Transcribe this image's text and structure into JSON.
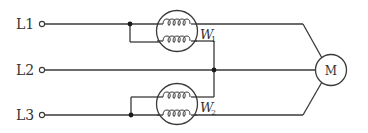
{
  "diagram": {
    "lines": [
      {
        "id": "L1",
        "label": "L1",
        "y": 24
      },
      {
        "id": "L2",
        "label": "L2",
        "y": 70
      },
      {
        "id": "L3",
        "label": "L3",
        "y": 115
      }
    ],
    "wattmeters": [
      {
        "id": "W1",
        "letter": "W",
        "subscript": "1"
      },
      {
        "id": "W2",
        "letter": "W",
        "subscript": "2"
      }
    ],
    "motor": {
      "label": "M"
    },
    "colors": {
      "line": "#3a3a3a",
      "background": "#ffffff"
    }
  }
}
